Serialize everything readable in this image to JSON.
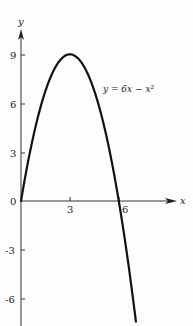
{
  "chart_data": {
    "type": "line",
    "title": "",
    "xlabel": "x",
    "ylabel": "y",
    "equation_label": "y = 6x − x²",
    "x_ticks": [
      "3",
      "6"
    ],
    "x_tick_values": [
      3,
      6
    ],
    "y_ticks": [
      "9",
      "6",
      "3",
      "0",
      "-3",
      "-6"
    ],
    "y_tick_values": [
      9,
      6,
      3,
      0,
      -3,
      -6
    ],
    "origin_label": "0",
    "xlim": [
      0,
      9.5
    ],
    "ylim": [
      -7.5,
      10.5
    ],
    "grid": false,
    "series": [
      {
        "name": "y = 6x − x²",
        "x": [
          0,
          0.5,
          1,
          1.5,
          2,
          2.5,
          3,
          3.5,
          4,
          4.5,
          5,
          5.5,
          6,
          6.5,
          7,
          7.05
        ],
        "values": [
          0,
          2.75,
          5,
          6.75,
          8,
          8.75,
          9,
          8.75,
          8,
          6.75,
          5,
          2.75,
          0,
          -3.25,
          -7,
          -7.35
        ]
      }
    ],
    "vertex": {
      "x": 3,
      "y": 9
    },
    "roots": [
      0,
      6
    ]
  },
  "colors": {
    "background": "#fdfdfb",
    "ink": "#1a1a1a"
  }
}
